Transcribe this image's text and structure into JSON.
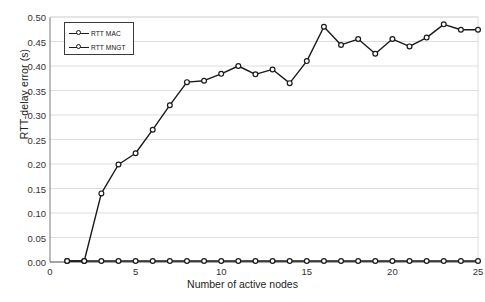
{
  "chart_data": {
    "type": "line",
    "title": "",
    "xlabel": "Number of active nodes",
    "ylabel": "RTT-delay error (s)",
    "xlim": [
      0,
      25
    ],
    "ylim": [
      0.0,
      0.5
    ],
    "grid": true,
    "legend_position": "top-left",
    "x": [
      1,
      2,
      3,
      4,
      5,
      6,
      7,
      8,
      9,
      10,
      11,
      12,
      13,
      14,
      15,
      16,
      17,
      18,
      19,
      20,
      21,
      22,
      23,
      24,
      25
    ],
    "xticks": [
      "0",
      "5",
      "10",
      "15",
      "20",
      "25"
    ],
    "xtick_values": [
      0,
      5,
      10,
      15,
      20,
      25
    ],
    "yticks": [
      "0.00",
      "0.05",
      "0.10",
      "0.15",
      "0.20",
      "0.25",
      "0.30",
      "0.35",
      "0.40",
      "0.45",
      "0.50"
    ],
    "ytick_values": [
      0.0,
      0.05,
      0.1,
      0.15,
      0.2,
      0.25,
      0.3,
      0.35,
      0.4,
      0.45,
      0.5
    ],
    "series": [
      {
        "name": "RTT MAC",
        "color": "#1a1a1a",
        "marker": "open-circle",
        "values": [
          0.002,
          0.002,
          0.002,
          0.002,
          0.002,
          0.002,
          0.002,
          0.002,
          0.002,
          0.002,
          0.002,
          0.002,
          0.002,
          0.002,
          0.002,
          0.002,
          0.002,
          0.002,
          0.002,
          0.002,
          0.002,
          0.002,
          0.002,
          0.002,
          0.002
        ]
      },
      {
        "name": "RTT MNGT",
        "color": "#1a1a1a",
        "marker": "open-circle",
        "values": [
          0.002,
          0.002,
          0.14,
          0.199,
          0.222,
          0.27,
          0.32,
          0.367,
          0.37,
          0.384,
          0.4,
          0.383,
          0.393,
          0.365,
          0.41,
          0.48,
          0.443,
          0.455,
          0.425,
          0.455,
          0.44,
          0.458,
          0.485,
          0.474,
          0.474
        ]
      }
    ]
  }
}
